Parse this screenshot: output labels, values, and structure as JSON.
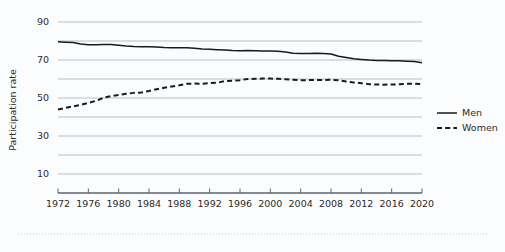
{
  "chart_data": {
    "type": "line",
    "title": "",
    "subtitle": "",
    "xlabel": "",
    "ylabel": "Participation rate",
    "xlim": [
      1972,
      2020
    ],
    "ylim": [
      0,
      95
    ],
    "grid": true,
    "grid_values": [
      10,
      20,
      30,
      40,
      50,
      60,
      70,
      80,
      90
    ],
    "ytick_labels": [
      "10",
      "30",
      "50",
      "70",
      "90"
    ],
    "ytick_values": [
      10,
      30,
      50,
      70,
      90
    ],
    "xtick_labels": [
      "1972",
      "1976",
      "1980",
      "1984",
      "1988",
      "1992",
      "1996",
      "2000",
      "2004",
      "2008",
      "2012",
      "2016",
      "2020"
    ],
    "xtick_values": [
      1972,
      1976,
      1980,
      1984,
      1988,
      1992,
      1996,
      2000,
      2004,
      2008,
      2012,
      2016,
      2020
    ],
    "legend_position": "right",
    "x": [
      1972,
      1973,
      1974,
      1975,
      1976,
      1977,
      1978,
      1979,
      1980,
      1981,
      1982,
      1983,
      1984,
      1985,
      1986,
      1987,
      1988,
      1989,
      1990,
      1991,
      1992,
      1993,
      1994,
      1995,
      1996,
      1997,
      1998,
      1999,
      2000,
      2001,
      2002,
      2003,
      2004,
      2005,
      2006,
      2007,
      2008,
      2009,
      2010,
      2011,
      2012,
      2013,
      2014,
      2015,
      2016,
      2017,
      2018,
      2019,
      2020
    ],
    "series": [
      {
        "name": "Men",
        "style": "solid",
        "color": "#1a1a1a",
        "values": [
          79.6,
          79.4,
          79.2,
          78.4,
          78.0,
          78.0,
          78.1,
          78.2,
          77.8,
          77.4,
          77.1,
          77.0,
          77.0,
          76.8,
          76.6,
          76.5,
          76.4,
          76.4,
          76.2,
          75.8,
          75.6,
          75.4,
          75.2,
          75.0,
          74.9,
          75.0,
          74.9,
          74.8,
          74.8,
          74.6,
          74.2,
          73.6,
          73.4,
          73.4,
          73.6,
          73.4,
          73.2,
          72.0,
          71.3,
          70.6,
          70.3,
          70.0,
          69.8,
          69.7,
          69.6,
          69.6,
          69.4,
          69.2,
          68.6
        ]
      },
      {
        "name": "Women",
        "style": "dashed",
        "color": "#1a1a1a",
        "values": [
          43.9,
          44.8,
          45.6,
          46.4,
          47.4,
          48.5,
          50.1,
          51.0,
          51.6,
          52.2,
          52.7,
          52.9,
          53.7,
          54.6,
          55.4,
          56.1,
          56.7,
          57.5,
          57.6,
          57.5,
          57.9,
          58.0,
          58.9,
          59.1,
          59.4,
          60.0,
          60.1,
          60.2,
          60.2,
          60.1,
          59.9,
          59.6,
          59.3,
          59.4,
          59.5,
          59.4,
          59.6,
          59.3,
          58.7,
          58.2,
          57.8,
          57.3,
          57.1,
          57.0,
          57.1,
          57.2,
          57.5,
          57.5,
          57.3
        ]
      }
    ],
    "legend": [
      {
        "label": "Men",
        "style": "solid"
      },
      {
        "label": "Women",
        "style": "dashed"
      }
    ]
  }
}
